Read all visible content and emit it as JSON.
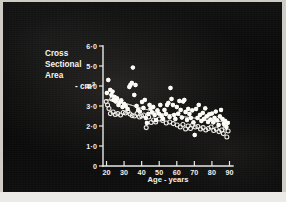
{
  "figure": {
    "media_type": "photographic-slide-scatter-plot",
    "background_color": "#0a0a0a",
    "ink_color": "#f7f6f1"
  },
  "chart_data": {
    "type": "scatter",
    "title": "",
    "ylabel_lines": [
      "Cross",
      "Sectional",
      "Area",
      "- cm²"
    ],
    "ylabel": "Cross Sectional Area - cm2",
    "xlabel": "Age - years",
    "xlim": [
      18,
      92
    ],
    "ylim": [
      0,
      6
    ],
    "xticks": [
      20,
      30,
      40,
      50,
      60,
      70,
      80,
      90
    ],
    "xtick_labels": [
      "20",
      "30",
      "40",
      "50",
      "60",
      "70",
      "80",
      "90"
    ],
    "yticks": [
      0,
      1,
      2,
      3,
      4,
      5,
      6
    ],
    "ytick_labels": [
      "0",
      "1·0",
      "2·0",
      "3·0",
      "4·0",
      "5·0",
      "6·0"
    ],
    "grid": false,
    "legend": [],
    "series": [
      {
        "name": "filled-circles",
        "marker": "filled circle",
        "color": "#fbfaf5",
        "points": [
          [
            20.2,
            3.65
          ],
          [
            21.0,
            4.3
          ],
          [
            22.1,
            3.8
          ],
          [
            22.8,
            3.55
          ],
          [
            23.4,
            3.72
          ],
          [
            24.0,
            3.3
          ],
          [
            24.6,
            3.45
          ],
          [
            25.2,
            3.22
          ],
          [
            26.0,
            3.38
          ],
          [
            26.8,
            3.05
          ],
          [
            27.5,
            3.18
          ],
          [
            28.4,
            3.28
          ],
          [
            29.1,
            2.95
          ],
          [
            30.0,
            3.1
          ],
          [
            30.9,
            3.0
          ],
          [
            32.0,
            2.85
          ],
          [
            33.0,
            3.95
          ],
          [
            33.6,
            4.05
          ],
          [
            34.4,
            4.15
          ],
          [
            35.0,
            4.92
          ],
          [
            35.8,
            3.55
          ],
          [
            36.5,
            4.05
          ],
          [
            37.1,
            3.0
          ],
          [
            38.0,
            2.8
          ],
          [
            39.0,
            2.72
          ],
          [
            40.2,
            3.2
          ],
          [
            41.0,
            2.9
          ],
          [
            41.8,
            3.3
          ],
          [
            42.4,
            2.4
          ],
          [
            43.0,
            2.15
          ],
          [
            43.8,
            2.6
          ],
          [
            44.5,
            3.05
          ],
          [
            45.1,
            2.88
          ],
          [
            45.9,
            2.68
          ],
          [
            46.6,
            2.95
          ],
          [
            47.4,
            2.55
          ],
          [
            48.2,
            2.3
          ],
          [
            49.0,
            2.78
          ],
          [
            49.8,
            2.62
          ],
          [
            50.6,
            3.05
          ],
          [
            51.4,
            2.5
          ],
          [
            52.2,
            2.35
          ],
          [
            53.0,
            2.8
          ],
          [
            53.8,
            2.6
          ],
          [
            54.5,
            3.05
          ],
          [
            55.2,
            3.15
          ],
          [
            55.9,
            2.45
          ],
          [
            56.4,
            3.9
          ],
          [
            57.0,
            3.35
          ],
          [
            57.8,
            3.05
          ],
          [
            58.5,
            2.55
          ],
          [
            59.2,
            2.35
          ],
          [
            60.0,
            2.95
          ],
          [
            60.8,
            2.62
          ],
          [
            61.5,
            3.25
          ],
          [
            62.2,
            2.8
          ],
          [
            62.9,
            2.42
          ],
          [
            63.6,
            3.22
          ],
          [
            64.3,
            3.3
          ],
          [
            65.0,
            2.7
          ],
          [
            65.8,
            2.3
          ],
          [
            66.5,
            2.85
          ],
          [
            67.2,
            2.6
          ],
          [
            68.0,
            2.4
          ],
          [
            68.8,
            2.78
          ],
          [
            69.5,
            2.18
          ],
          [
            70.2,
            1.55
          ],
          [
            71.0,
            2.85
          ],
          [
            71.8,
            2.4
          ],
          [
            72.5,
            3.05
          ],
          [
            73.2,
            2.55
          ],
          [
            74.0,
            2.25
          ],
          [
            74.8,
            2.65
          ],
          [
            75.5,
            2.35
          ],
          [
            76.2,
            2.88
          ],
          [
            77.0,
            2.48
          ],
          [
            77.8,
            2.2
          ],
          [
            78.5,
            2.58
          ],
          [
            79.2,
            2.32
          ],
          [
            80.0,
            2.62
          ],
          [
            80.8,
            2.18
          ],
          [
            81.5,
            2.4
          ],
          [
            82.2,
            2.72
          ],
          [
            83.0,
            2.28
          ],
          [
            83.8,
            2.05
          ],
          [
            84.5,
            2.48
          ],
          [
            85.2,
            2.8
          ],
          [
            86.0,
            2.35
          ],
          [
            86.8,
            2.1
          ],
          [
            87.5,
            2.25
          ],
          [
            88.2,
            1.95
          ],
          [
            89.0,
            2.15
          ]
        ]
      },
      {
        "name": "open-circles",
        "marker": "open circle",
        "color": "#efeee8",
        "points": [
          [
            19.8,
            3.22
          ],
          [
            20.6,
            3.05
          ],
          [
            21.4,
            2.88
          ],
          [
            22.2,
            2.62
          ],
          [
            23.0,
            3.35
          ],
          [
            23.8,
            2.7
          ],
          [
            25.0,
            2.58
          ],
          [
            26.4,
            2.62
          ],
          [
            28.0,
            2.55
          ],
          [
            29.5,
            2.68
          ],
          [
            30.8,
            2.65
          ],
          [
            32.2,
            2.72
          ],
          [
            33.4,
            2.6
          ],
          [
            34.6,
            2.52
          ],
          [
            36.0,
            2.5
          ],
          [
            37.4,
            2.62
          ],
          [
            38.8,
            2.45
          ],
          [
            40.0,
            2.5
          ],
          [
            41.2,
            2.55
          ],
          [
            42.6,
            1.92
          ],
          [
            44.0,
            2.45
          ],
          [
            45.4,
            2.18
          ],
          [
            46.8,
            2.3
          ],
          [
            48.0,
            2.2
          ],
          [
            50.0,
            2.35
          ],
          [
            52.0,
            2.28
          ],
          [
            54.0,
            2.15
          ],
          [
            56.0,
            2.2
          ],
          [
            58.0,
            2.12
          ],
          [
            60.2,
            2.05
          ],
          [
            62.0,
            1.95
          ],
          [
            63.5,
            2.08
          ],
          [
            65.0,
            1.85
          ],
          [
            66.4,
            2.0
          ],
          [
            67.8,
            1.88
          ],
          [
            69.0,
            2.05
          ],
          [
            70.5,
            1.95
          ],
          [
            72.0,
            1.98
          ],
          [
            73.5,
            1.85
          ],
          [
            75.0,
            1.92
          ],
          [
            76.5,
            1.8
          ],
          [
            78.0,
            1.88
          ],
          [
            79.5,
            1.95
          ],
          [
            81.0,
            1.78
          ],
          [
            82.5,
            1.85
          ],
          [
            84.0,
            1.72
          ],
          [
            85.5,
            1.8
          ],
          [
            86.5,
            1.62
          ],
          [
            87.5,
            1.9
          ],
          [
            88.5,
            1.45
          ],
          [
            89.2,
            1.75
          ]
        ]
      }
    ],
    "trend_line": {
      "name": "fitted mean trend",
      "color": "#d8d6cf",
      "points": [
        [
          20,
          3.3
        ],
        [
          25,
          3.32
        ],
        [
          30,
          3.15
        ],
        [
          35,
          3.02
        ],
        [
          40,
          2.88
        ],
        [
          45,
          2.78
        ],
        [
          50,
          2.62
        ],
        [
          55,
          2.58
        ],
        [
          60,
          2.55
        ],
        [
          65,
          2.45
        ],
        [
          70,
          2.4
        ],
        [
          75,
          2.3
        ],
        [
          80,
          2.28
        ],
        [
          85,
          2.22
        ],
        [
          90,
          2.22
        ]
      ]
    }
  }
}
